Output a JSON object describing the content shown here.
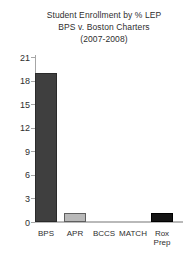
{
  "chart_data": {
    "type": "bar",
    "title": "Student Enrollment by % LEP",
    "subtitle": "BPS v. Boston Charters",
    "period": "(2007-2008)",
    "categories": [
      "BPS",
      "APR",
      "BCCS",
      "MATCH",
      "Rox Prep"
    ],
    "values": [
      19,
      1.1,
      0,
      0,
      1.2
    ],
    "bar_fill_colors": [
      "#3f3f3f",
      "#b9b9b9",
      "#3f3f3f",
      "#3f3f3f",
      "#141414"
    ],
    "bar_border_colors": [
      "#2a2a2a",
      "#5f5f5f",
      "#2a2a2a",
      "#2a2a2a",
      "#000000"
    ],
    "xlabel": "",
    "ylabel": "",
    "ylim": [
      0,
      21
    ],
    "yticks": [
      0,
      3,
      6,
      9,
      12,
      15,
      18,
      21
    ],
    "grid": "off",
    "legend": "none",
    "axis_color": "#a6a6a6",
    "text_color": "#2e2e2e",
    "background_color": "#ffffff"
  }
}
